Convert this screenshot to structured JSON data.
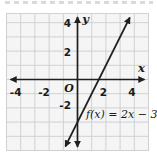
{
  "chart_data": {
    "type": "line",
    "title": "",
    "xlabel": "x",
    "ylabel": "y",
    "origin_label": "O",
    "xlim": [
      -5,
      5
    ],
    "ylim": [
      -5,
      5
    ],
    "grid": true,
    "x_ticks": [
      -4,
      -2,
      2,
      4
    ],
    "x_tick_labels": [
      "-4",
      "-2",
      "2",
      "4"
    ],
    "y_ticks": [
      4,
      2,
      -2
    ],
    "y_tick_labels": [
      "4",
      "2",
      "-2"
    ],
    "series": [
      {
        "name": "f(x) = 2x - 3",
        "equation": "f(x) = 2x − 3",
        "slope": 2,
        "y_intercept": -3,
        "x_intercept": 1.5,
        "style": "solid dark line with arrowheads on both ends"
      }
    ],
    "legend": "none",
    "annotation_position": "equation label below x-axis, right of the line"
  },
  "colors": {
    "axis": "#1f1f1f",
    "line": "#1f1f1f",
    "grid": "#cfd1d4",
    "plot_background": "#f5f5f6",
    "page_background": "#ffffff",
    "text": "#1a1a1a"
  }
}
